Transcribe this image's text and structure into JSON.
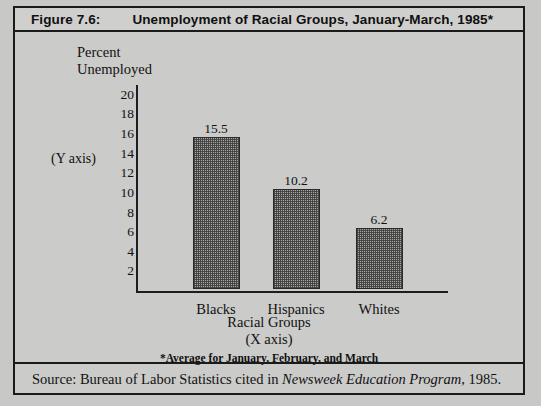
{
  "header": {
    "figure_number": "Figure 7.6:",
    "title": "Unemployment of Racial Groups, January-March, 1985*"
  },
  "source": {
    "prefix": "Source:  Bureau of Labor Statistics cited in ",
    "italic": "Newsweek Education Program",
    "suffix": ", 1985."
  },
  "chart_data": {
    "type": "bar",
    "title": "Unemployment of Racial Groups, January-March, 1985*",
    "categories": [
      "Blacks",
      "Hispanics",
      "Whites"
    ],
    "values": [
      15.5,
      10.2,
      6.2
    ],
    "value_labels": [
      "15.5",
      "10.2",
      "6.2"
    ],
    "ylabel_line1": "Percent",
    "ylabel_line2": "Unemployed",
    "y_axis_caption": "(Y axis)",
    "xlabel_line1": "Racial Groups",
    "xlabel_line2": "(X axis)",
    "ylim": [
      0,
      21
    ],
    "yticks": [
      "20",
      "18",
      "16",
      "14",
      "12",
      "10",
      "8",
      "6",
      "4",
      "2"
    ],
    "ytick_values": [
      20,
      18,
      16,
      14,
      12,
      10,
      8,
      6,
      4,
      2
    ],
    "grid": false,
    "legend": "none",
    "footnote": "*Average for January, February, and March",
    "bar_color": "#a6a6a4",
    "bar_border_color": "#2a2a2a",
    "axis_color": "#1d1d1d",
    "background": "#cbcbc9"
  }
}
